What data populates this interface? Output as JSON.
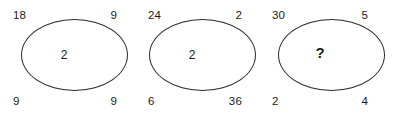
{
  "puzzle": {
    "type": "number-analogy-ellipse-puzzle",
    "background_color": "#ffffff",
    "stroke_color": "#2b2b2b",
    "text_color": "#1a1a1a",
    "groups": [
      {
        "name": "ellipse-group-1",
        "top_left": "18",
        "top_right": "9",
        "bottom_left": "9",
        "bottom_right": "9",
        "center": "2"
      },
      {
        "name": "ellipse-group-2",
        "top_left": "24",
        "top_right": "2",
        "bottom_left": "6",
        "bottom_right": "36",
        "center": "2"
      },
      {
        "name": "ellipse-group-3",
        "top_left": "30",
        "top_right": "5",
        "bottom_left": "2",
        "bottom_right": "4",
        "center": "?"
      }
    ]
  }
}
